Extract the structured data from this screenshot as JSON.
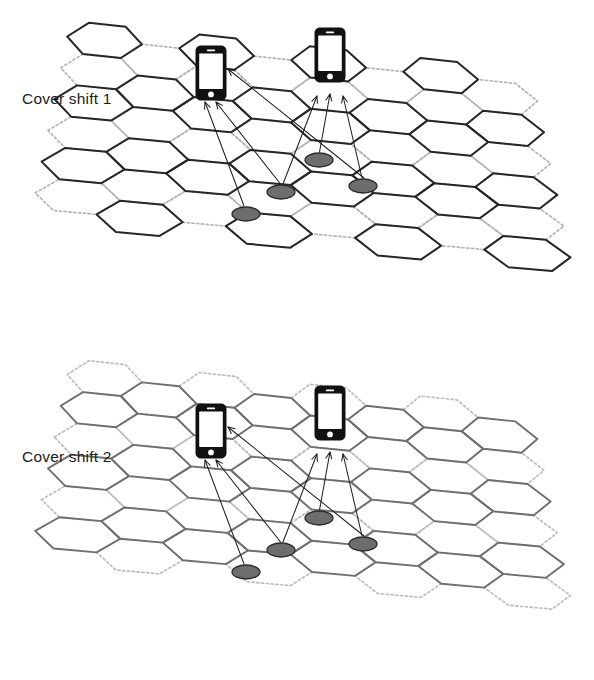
{
  "figure": {
    "width": 594,
    "height": 680,
    "background": "#ffffff"
  },
  "colors": {
    "panel1_active_cell": "#262626",
    "panel1_inactive_cell": "#b4b4b4",
    "panel2_active_cell": "#6f6f6f",
    "panel2_inactive_cell": "#bdbdbd",
    "ray_line": "#1f1f1f",
    "user_marker_fill": "#6d6d6d",
    "user_marker_stroke": "#2b2b2b",
    "phone_body": "#111111",
    "phone_screen": "#ffffff",
    "label_text": "#1c1c1c"
  },
  "panels": [
    {
      "id": "panel-cover-shift-1",
      "label": "Cover shift 1",
      "label_x": 22,
      "label_y": 104,
      "origin_y": 0,
      "active_style": "hex-active-1",
      "inactive_style": "hex-inactive-1",
      "active_cells": "solid dark outlines",
      "inactive_cells": "light dotted outlines",
      "phones": [
        {
          "name": "phone-left",
          "x": 196,
          "y": 46,
          "w": 30,
          "h": 54
        },
        {
          "name": "phone-right",
          "x": 315,
          "y": 28,
          "w": 30,
          "h": 54
        }
      ],
      "users": [
        {
          "name": "user-terminal-1",
          "x": 246,
          "y": 214,
          "rx": 14,
          "ry": 7
        },
        {
          "name": "user-terminal-2",
          "x": 281,
          "y": 192,
          "rx": 14,
          "ry": 7
        },
        {
          "name": "user-terminal-3",
          "x": 363,
          "y": 186,
          "rx": 14,
          "ry": 7
        },
        {
          "name": "user-terminal-4",
          "x": 319,
          "y": 160,
          "rx": 14,
          "ry": 7
        }
      ]
    },
    {
      "id": "panel-cover-shift-2",
      "label": "Cover shift 2",
      "label_x": 22,
      "label_y": 462,
      "origin_y": 338,
      "active_style": "hex-active-2",
      "inactive_style": "hex-inactive-2",
      "active_cells": "solid gray outlines",
      "inactive_cells": "light dotted outlines",
      "phones": [
        {
          "name": "phone-left",
          "x": 196,
          "y": 404,
          "w": 30,
          "h": 54
        },
        {
          "name": "phone-right",
          "x": 315,
          "y": 386,
          "w": 30,
          "h": 54
        }
      ],
      "users": [
        {
          "name": "user-terminal-1",
          "x": 246,
          "y": 572,
          "rx": 14,
          "ry": 7
        },
        {
          "name": "user-terminal-2",
          "x": 281,
          "y": 550,
          "rx": 14,
          "ry": 7
        },
        {
          "name": "user-terminal-3",
          "x": 363,
          "y": 544,
          "rx": 14,
          "ry": 7
        },
        {
          "name": "user-terminal-4",
          "x": 319,
          "y": 518,
          "rx": 14,
          "ry": 7
        }
      ]
    }
  ],
  "legend_semantics": {
    "solid_cell": "cell active during this cover shift",
    "dotted_cell": "cell inactive during this cover shift",
    "ellipse": "user terminal / UE on the ground",
    "phone": "receiving mobile device",
    "arrow": "uplink transmission from user terminal to device"
  }
}
